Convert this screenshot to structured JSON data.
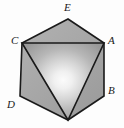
{
  "figure": {
    "kind": "geometry-diagram",
    "width": 124,
    "height": 128,
    "background_color": "#fdfdfd",
    "stroke_color": "#1a1a1a",
    "stroke_width": 1.6,
    "fill_outer_color": "#a9a9a9",
    "fill_inner_center_color": "#f7f7f7",
    "fill_inner_edge_color": "#9a9a9a",
    "hexagon": {
      "name": "hexagon-outline",
      "points": "68,19 104,43 104,96 68,120 20,96 22,43",
      "vertices": [
        {
          "label": "E",
          "x": 68,
          "y": 19
        },
        {
          "label": "A",
          "x": 104,
          "y": 43
        },
        {
          "label": "B",
          "x": 104,
          "y": 96
        },
        {
          "label": "",
          "x": 68,
          "y": 120
        },
        {
          "label": "D",
          "x": 20,
          "y": 96
        },
        {
          "label": "C",
          "x": 22,
          "y": 43
        }
      ]
    },
    "triangle": {
      "name": "inscribed-triangle",
      "points": "22,43 104,43 68,120",
      "vertex_labels": [
        "C",
        "A",
        ""
      ]
    },
    "labels": [
      {
        "id": "E",
        "text": "E",
        "x": 64,
        "y": 2
      },
      {
        "id": "C",
        "text": "C",
        "x": 11,
        "y": 35
      },
      {
        "id": "A",
        "text": "A",
        "x": 108,
        "y": 35
      },
      {
        "id": "D",
        "text": "D",
        "x": 7,
        "y": 99
      },
      {
        "id": "B",
        "text": "B",
        "x": 108,
        "y": 85
      }
    ]
  }
}
